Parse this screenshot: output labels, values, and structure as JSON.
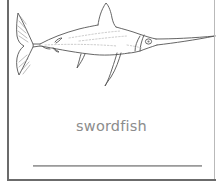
{
  "card": {
    "type": "flashcard",
    "background_color": "#ffffff",
    "border_color": "#6b6b6b",
    "border_color_light": "#b9b9b9"
  },
  "illustration": {
    "name": "swordfish-line-drawing",
    "description": "Black-and-white line art of a swordfish facing right with a long pointed bill, tall curved dorsal fin, long sweeping pectoral fin, and a crescent-shaped hatched tail fin",
    "line_color": "#555555",
    "detail_color": "#9a9a9a",
    "fill_color": "#ffffff"
  },
  "label": {
    "text": "swordfish",
    "color": "#8c8c8c"
  },
  "writing_line": {
    "name": "handwriting-line",
    "color": "#9a9a9a"
  }
}
